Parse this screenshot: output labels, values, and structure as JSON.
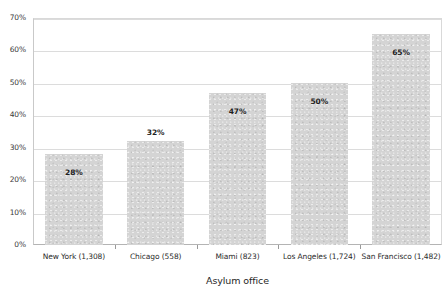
{
  "chart_data": {
    "type": "bar",
    "title": "",
    "xlabel": "Asylum office",
    "ylabel": "",
    "categories": [
      "New York (1,308)",
      "Chicago (558)",
      "Miami (823)",
      "Los Angeles (1,724)",
      "San Francisco (1,482)"
    ],
    "values": [
      28,
      32,
      47,
      50,
      65
    ],
    "value_labels": [
      "28%",
      "32%",
      "47%",
      "50%",
      "65%"
    ],
    "ylim": [
      0,
      70
    ],
    "ytick_values": [
      0,
      10,
      20,
      30,
      40,
      50,
      60,
      70
    ],
    "ytick_labels": [
      "0%",
      "10%",
      "20%",
      "30%",
      "40%",
      "50%",
      "60%",
      "70%"
    ],
    "grid": true,
    "legend": false,
    "legend_position": "none",
    "bar_color": "#d4d4d4",
    "gridline_color": "#dcdcdc",
    "axis_color": "#b4b4b4",
    "label_placement": [
      "inside",
      "above",
      "inside",
      "inside",
      "inside"
    ]
  }
}
